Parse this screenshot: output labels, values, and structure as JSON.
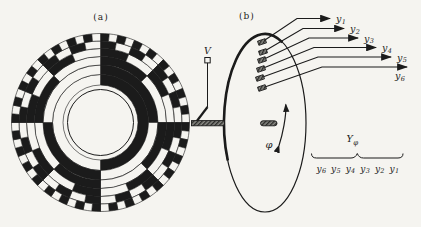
{
  "background": "#f5f4f0",
  "ink": "#1b1b1b",
  "panel_a": {
    "label": "(a)",
    "description": "six-track binary coded disk",
    "disk": {
      "tracks": 6,
      "code": "binary",
      "outer_sectors": 64
    }
  },
  "panel_b": {
    "label": "(b)",
    "source_label": "V",
    "rotation_label": "φ",
    "group_label": {
      "base": "Y",
      "sub": "φ"
    },
    "outputs": [
      {
        "base": "y",
        "sub": "1"
      },
      {
        "base": "y",
        "sub": "2"
      },
      {
        "base": "y",
        "sub": "3"
      },
      {
        "base": "y",
        "sub": "4"
      },
      {
        "base": "y",
        "sub": "5"
      },
      {
        "base": "y",
        "sub": "6"
      }
    ],
    "sequence": [
      {
        "base": "y",
        "sub": "6"
      },
      {
        "base": "y",
        "sub": "5"
      },
      {
        "base": "y",
        "sub": "4"
      },
      {
        "base": "y",
        "sub": "3"
      },
      {
        "base": "y",
        "sub": "2"
      },
      {
        "base": "y",
        "sub": "1"
      }
    ]
  }
}
